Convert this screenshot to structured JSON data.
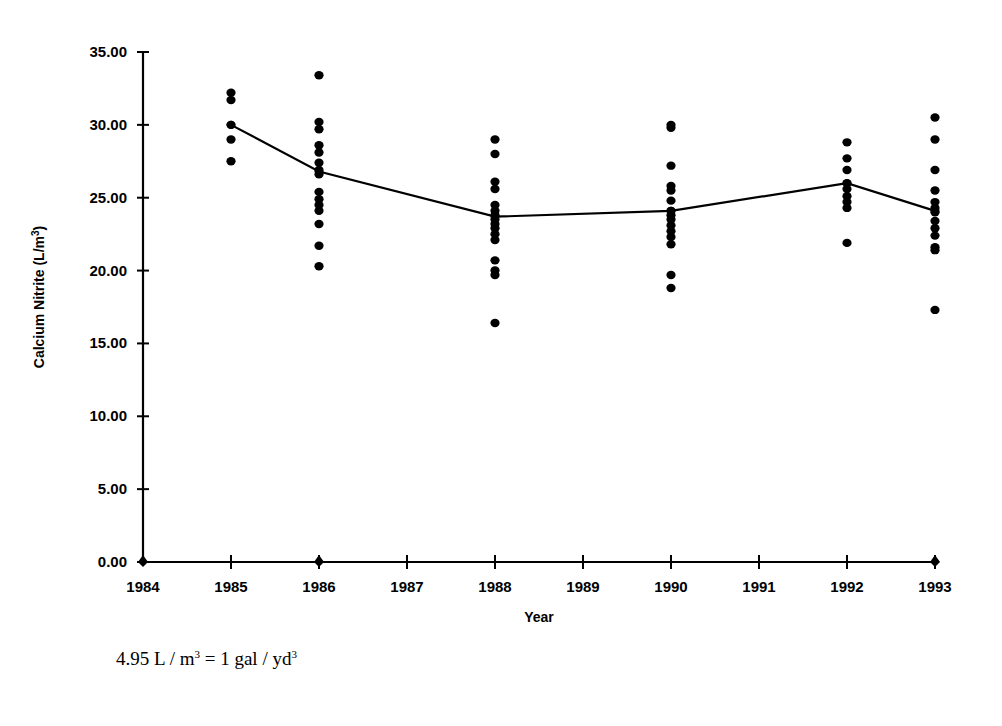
{
  "figure": {
    "footnote_prefix": "4.95 L / m",
    "footnote_sup1": "3",
    "footnote_middle": " = 1 gal / yd",
    "footnote_sup2": "3",
    "footnote_full": "4.95 L / m3 = 1 gal / yd3"
  },
  "chart_data": {
    "type": "scatter",
    "title": "",
    "subtitle": "",
    "xlabel": "Year",
    "ylabel": "Calcium Nitrite (L/m3)",
    "ylabel_text": "Calcium Nitrite (L/m",
    "ylabel_sup": "3",
    "ylabel_suffix": ")",
    "xlim": [
      1984,
      1993
    ],
    "ylim": [
      0,
      35
    ],
    "ytick_step": 5,
    "grid": false,
    "legend": false,
    "legend_position": "none",
    "marker_color": "#000000",
    "line_color": "#000000",
    "xticks": [
      1984,
      1985,
      1986,
      1987,
      1988,
      1989,
      1990,
      1991,
      1992,
      1993
    ],
    "xtick_labels": [
      "1984",
      "1985",
      "1986",
      "1987",
      "1988",
      "1989",
      "1990",
      "1991",
      "1992",
      "1993"
    ],
    "yticks": [
      0,
      5,
      10,
      15,
      20,
      25,
      30,
      35
    ],
    "ytick_labels": [
      "0.00",
      "5.00",
      "10.00",
      "15.00",
      "20.00",
      "25.00",
      "30.00",
      "35.00"
    ],
    "series": [
      {
        "name": "Mean Calcium Nitrite",
        "type": "line",
        "x": [
          1985,
          1986,
          1988,
          1990,
          1992,
          1993
        ],
        "values": [
          30.0,
          26.8,
          23.7,
          24.1,
          26.0,
          24.1
        ]
      },
      {
        "name": "Individual observations",
        "type": "scatter",
        "points": [
          {
            "year": 1984,
            "values": [
              0.0
            ]
          },
          {
            "year": 1985,
            "values": [
              32.2,
              31.7,
              30.0,
              29.0,
              27.5
            ]
          },
          {
            "year": 1986,
            "values": [
              33.4,
              30.2,
              29.7,
              28.6,
              28.1,
              27.4,
              26.9,
              26.6,
              25.4,
              24.9,
              24.5,
              24.1,
              23.2,
              21.7,
              20.3,
              0.0
            ]
          },
          {
            "year": 1988,
            "values": [
              29.0,
              28.0,
              26.1,
              25.6,
              24.5,
              24.1,
              23.8,
              23.5,
              23.2,
              22.9,
              22.5,
              22.1,
              20.7,
              20.0,
              19.7,
              16.4
            ]
          },
          {
            "year": 1990,
            "values": [
              30.0,
              29.8,
              27.2,
              25.8,
              25.5,
              24.8,
              24.1,
              23.8,
              23.5,
              23.1,
              22.7,
              22.3,
              21.8,
              19.7,
              18.8
            ]
          },
          {
            "year": 1992,
            "values": [
              28.8,
              27.7,
              26.9,
              26.0,
              25.6,
              25.1,
              24.7,
              24.3,
              21.9
            ]
          },
          {
            "year": 1993,
            "values": [
              30.5,
              29.0,
              26.9,
              25.5,
              24.7,
              24.3,
              24.0,
              23.4,
              22.9,
              22.4,
              21.6,
              21.4,
              17.3,
              0.0
            ]
          }
        ]
      }
    ]
  }
}
